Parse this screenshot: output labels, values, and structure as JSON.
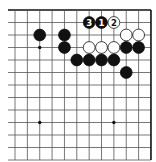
{
  "diagram": {
    "type": "go-board-fragment",
    "corner": "top-right",
    "grid": {
      "columns_visible": 12,
      "rows_visible": 13,
      "origin_x": 15,
      "origin_y": 10,
      "spacing_x": 12.36,
      "spacing_y": 12.5,
      "left_extend_x": 8,
      "bottom_extend_y": 160,
      "line_color": "#555555",
      "edge_color": "#111111"
    },
    "star_points": [
      {
        "col": 2,
        "row": 3
      },
      {
        "col": 8,
        "row": 3
      },
      {
        "col": 2,
        "row": 9
      },
      {
        "col": 8,
        "row": 9
      }
    ],
    "stones": [
      {
        "color": "black",
        "col": 2,
        "row": 2,
        "label": ""
      },
      {
        "color": "black",
        "col": 4,
        "row": 2,
        "label": ""
      },
      {
        "color": "black",
        "col": 4,
        "row": 3,
        "label": ""
      },
      {
        "color": "black",
        "col": 6,
        "row": 1,
        "label": "3"
      },
      {
        "color": "black",
        "col": 7,
        "row": 1,
        "label": "1"
      },
      {
        "color": "white",
        "col": 8,
        "row": 1,
        "label": "2"
      },
      {
        "color": "white",
        "col": 9,
        "row": 2,
        "label": ""
      },
      {
        "color": "white",
        "col": 10,
        "row": 2,
        "label": ""
      },
      {
        "color": "white",
        "col": 6,
        "row": 3,
        "label": ""
      },
      {
        "color": "white",
        "col": 7,
        "row": 3,
        "label": ""
      },
      {
        "color": "white",
        "col": 8,
        "row": 3,
        "label": ""
      },
      {
        "color": "black",
        "col": 9,
        "row": 3,
        "label": ""
      },
      {
        "color": "black",
        "col": 10,
        "row": 3,
        "label": ""
      },
      {
        "color": "black",
        "col": 5,
        "row": 4,
        "label": ""
      },
      {
        "color": "black",
        "col": 6,
        "row": 4,
        "label": ""
      },
      {
        "color": "black",
        "col": 7,
        "row": 4,
        "label": ""
      },
      {
        "color": "black",
        "col": 8,
        "row": 4,
        "label": ""
      },
      {
        "color": "black",
        "col": 9,
        "row": 5,
        "label": ""
      }
    ]
  }
}
